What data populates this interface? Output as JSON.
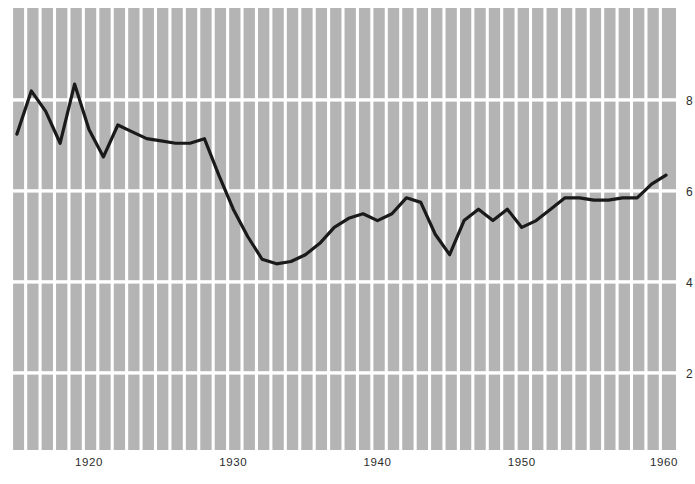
{
  "chart_data": {
    "type": "line",
    "title": "",
    "subtitle": "",
    "xlabel": "",
    "ylabel": "",
    "xlim": [
      1915,
      1960
    ],
    "ylim": [
      0.9,
      9.0
    ],
    "grid": true,
    "grid_style": "vertical bands plus horizontal lines at even values",
    "legend": null,
    "legend_position": "none",
    "x_tick_labels": [
      "1920",
      "1930",
      "1940",
      "1950",
      "1960"
    ],
    "x_tick_values": [
      1920,
      1930,
      1940,
      1950,
      1960
    ],
    "y_tick_labels": [
      "8",
      "6",
      "4",
      "2"
    ],
    "y_tick_values": [
      8,
      6,
      4,
      2
    ],
    "line_color": "#1a1a1a",
    "line_width": 3.2,
    "plot_background": "#b4b4b4",
    "gridline_color": "#ffffff",
    "x": [
      1915,
      1916,
      1917,
      1918,
      1919,
      1920,
      1921,
      1922,
      1923,
      1924,
      1925,
      1926,
      1927,
      1928,
      1929,
      1930,
      1931,
      1932,
      1933,
      1934,
      1935,
      1936,
      1937,
      1938,
      1939,
      1940,
      1941,
      1942,
      1943,
      1944,
      1945,
      1946,
      1947,
      1948,
      1949,
      1950,
      1951,
      1952,
      1953,
      1954,
      1955,
      1956,
      1957,
      1958,
      1959,
      1960
    ],
    "series": [
      {
        "name": "value",
        "values": [
          7.25,
          8.2,
          7.75,
          7.05,
          8.35,
          7.35,
          6.75,
          7.45,
          7.3,
          7.15,
          7.1,
          7.05,
          7.05,
          7.15,
          6.35,
          5.6,
          5.0,
          4.5,
          4.4,
          4.45,
          4.6,
          4.85,
          5.2,
          5.4,
          5.5,
          5.35,
          5.5,
          5.85,
          5.75,
          5.05,
          4.6,
          5.35,
          5.6,
          5.35,
          5.6,
          5.2,
          5.35,
          5.6,
          5.85,
          5.85,
          5.8,
          5.8,
          5.85,
          5.85,
          6.15,
          6.35
        ]
      }
    ]
  },
  "figure": {
    "background_color": "#ffffff",
    "plot_area": {
      "left": 10,
      "top": 8,
      "width": 666,
      "height": 442
    }
  }
}
